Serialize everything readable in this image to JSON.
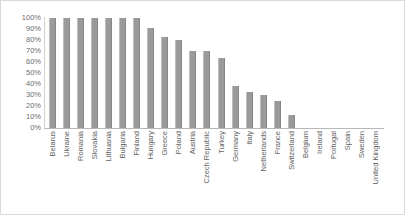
{
  "chart_data": {
    "type": "bar",
    "title": "",
    "xlabel": "",
    "ylabel": "",
    "ylim": [
      0,
      100
    ],
    "grid": false,
    "legend": "none",
    "yticks": [
      "100%",
      "90%",
      "80%",
      "70%",
      "60%",
      "50%",
      "40%",
      "30%",
      "20%",
      "10%",
      "0%"
    ],
    "categories": [
      "Belarus",
      "Ukraine",
      "Romania",
      "Slovakia",
      "Lithuania",
      "Bulgaria",
      "Finland",
      "Hungary",
      "Greece",
      "Poland",
      "Austria",
      "Czech Republic",
      "Turkey",
      "Germany",
      "Italy",
      "Netherlands",
      "France",
      "Switzerland",
      "Belgium",
      "Ireland",
      "Portugal",
      "Spain",
      "Sweden",
      "United Kingdom"
    ],
    "values": [
      100,
      100,
      100,
      100,
      100,
      100,
      100,
      91,
      83,
      80,
      70,
      70,
      64,
      38,
      33,
      30,
      25,
      12,
      0,
      0,
      0,
      0,
      0,
      0
    ],
    "bar_color": "#9a9a9a",
    "axis_color": "#b8b8b8",
    "label_color": "#5f5f5f",
    "background": "#ffffff",
    "border_color": "#d9d9d9"
  }
}
